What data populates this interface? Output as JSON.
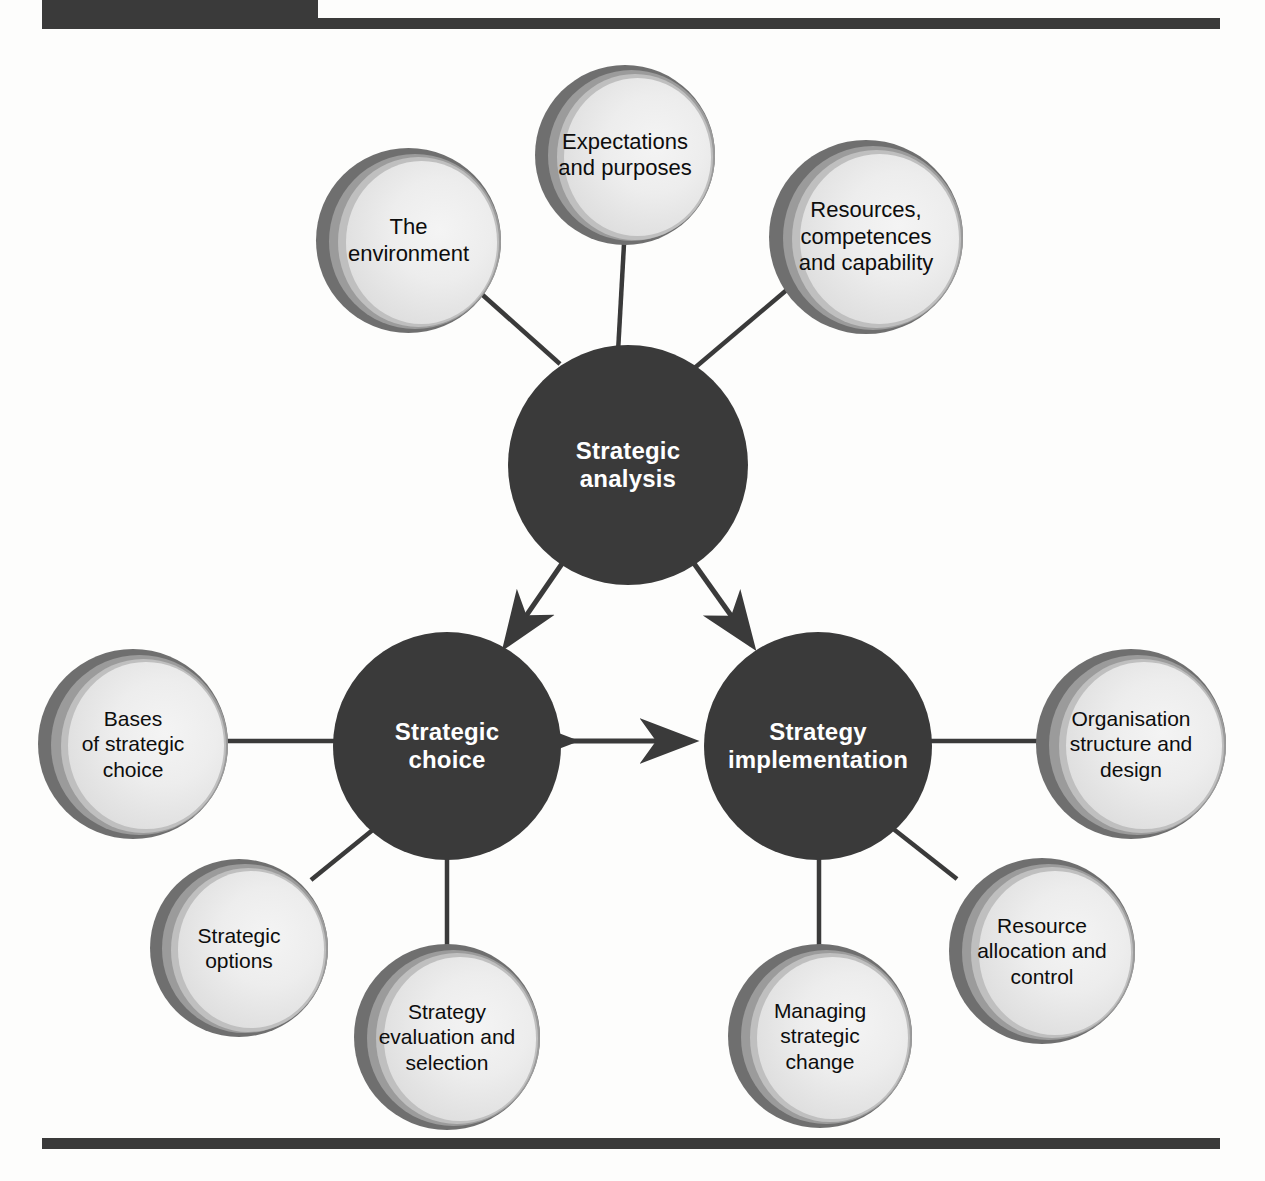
{
  "figure": {
    "line_color": "#3a3a3a",
    "hub_fill": "#3a3a3a",
    "hub_text_color": "#ffffff",
    "satellite_outer_ring": "#6f6f6f",
    "satellite_mid_ring": "#9b9b9b",
    "satellite_inner_ring": "#bfbfbf",
    "satellite_disc": "#ededed",
    "satellite_text_color": "#0d0d0d",
    "background": "#fdfdfc"
  },
  "hubs": [
    {
      "id": "strategic-analysis",
      "line1": "Strategic",
      "line2": "analysis"
    },
    {
      "id": "strategic-choice",
      "line1": "Strategic",
      "line2": "choice"
    },
    {
      "id": "strategy-implementation",
      "line1": "Strategy",
      "line2": "implementation"
    }
  ],
  "satellites": {
    "the_environment": "The\nenvironment",
    "expectations": "Expectations\nand purposes",
    "resources": "Resources,\ncompetences\nand capability",
    "bases_of_choice": "Bases\nof strategic\nchoice",
    "strategic_options": "Strategic\noptions",
    "evaluation_selection": "Strategy\nevaluation and\nselection",
    "organisation": "Organisation\nstructure and\ndesign",
    "resource_allocation": "Resource\nallocation and\ncontrol",
    "managing_change": "Managing\nstrategic\nchange"
  },
  "connectors": {
    "analysis_to_choice": "double-headed-arrow",
    "analysis_to_implementation": "double-headed-arrow",
    "choice_to_implementation": "double-headed-arrow",
    "spoke": "plain-line"
  }
}
